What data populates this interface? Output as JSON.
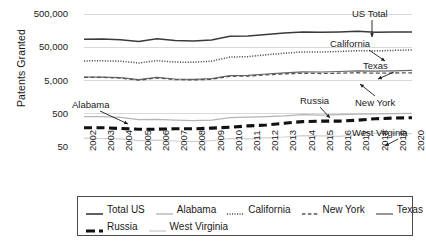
{
  "chart_data": {
    "type": "line",
    "title": "",
    "xlabel": "",
    "ylabel": "Patents Granted",
    "yscale": "log",
    "ylim": [
      50,
      500000
    ],
    "ytick_labels": [
      "500,000",
      "50,000",
      "5,000",
      "500",
      "50"
    ],
    "ytick_values": [
      500000,
      50000,
      5000,
      500,
      50
    ],
    "grid": true,
    "legend_position": "bottom",
    "x": [
      2002,
      2003,
      2004,
      2005,
      2006,
      2007,
      2008,
      2009,
      2010,
      2011,
      2012,
      2013,
      2014,
      2015,
      2016,
      2017,
      2018,
      2019,
      2020
    ],
    "categories": [
      "2002",
      "2003",
      "2004",
      "2005",
      "2006",
      "2007",
      "2008",
      "2009",
      "2010",
      "2011",
      "2012",
      "2013",
      "2014",
      "2015",
      "2016",
      "2017",
      "2018",
      "2019",
      "2020"
    ],
    "series": [
      {
        "name": "Total US",
        "key": "total_us",
        "style": "solid-dark",
        "values": [
          86977,
          87900,
          84271,
          74637,
          89823,
          79526,
          77501,
          82382,
          107792,
          108626,
          121026,
          133593,
          144621,
          140969,
          143723,
          150949,
          142000,
          143000,
          145000
        ]
      },
      {
        "name": "Alabama",
        "key": "alabama",
        "style": "solid-light",
        "values": [
          410,
          407,
          390,
          333,
          341,
          322,
          312,
          320,
          381,
          395,
          411,
          432,
          470,
          455,
          471,
          488,
          500,
          505,
          515
        ]
      },
      {
        "name": "California",
        "key": "california",
        "style": "dotted",
        "values": [
          19400,
          19500,
          19000,
          16800,
          19700,
          17900,
          17700,
          19200,
          25300,
          26100,
          29600,
          33100,
          36300,
          35900,
          37200,
          39500,
          38700,
          40100,
          41500
        ]
      },
      {
        "name": "New York",
        "key": "new_york",
        "style": "dashed",
        "values": [
          6220,
          6180,
          5900,
          5120,
          5980,
          5320,
          5200,
          5420,
          6700,
          6800,
          7400,
          7900,
          8300,
          8100,
          8300,
          8600,
          8300,
          8400,
          8500
        ]
      },
      {
        "name": "Texas",
        "key": "texas",
        "style": "solid-mid",
        "values": [
          6380,
          6330,
          6050,
          5300,
          6200,
          5550,
          5450,
          5700,
          7000,
          7150,
          7850,
          8500,
          9100,
          9000,
          9300,
          9700,
          9500,
          9800,
          10100
        ]
      },
      {
        "name": "Russia",
        "key": "russia",
        "style": "thick-dashed",
        "values": [
          190,
          190,
          180,
          172,
          172,
          176,
          176,
          185,
          195,
          215,
          230,
          260,
          290,
          300,
          300,
          320,
          355,
          370,
          380
        ]
      },
      {
        "name": "West Virginia",
        "key": "west_virginia",
        "style": "solid-pale",
        "values": [
          92,
          90,
          88,
          78,
          80,
          76,
          72,
          78,
          90,
          88,
          94,
          100,
          110,
          108,
          104,
          118,
          130,
          128,
          126
        ]
      }
    ],
    "annotations": [
      {
        "label": "US Total",
        "target_series": "total_us"
      },
      {
        "label": "California",
        "target_series": "california"
      },
      {
        "label": "Texas",
        "target_series": "texas"
      },
      {
        "label": "New York",
        "target_series": "new_york"
      },
      {
        "label": "Alabama",
        "target_series": "alabama"
      },
      {
        "label": "Russia",
        "target_series": "russia"
      },
      {
        "label": "West Virginia",
        "target_series": "west_virginia"
      }
    ]
  },
  "axis": {
    "y_title": "Patents Granted",
    "y_ticks": [
      "500,000",
      "50,000",
      "5,000",
      "500",
      "50"
    ],
    "x_ticks": [
      "2002",
      "2003",
      "2004",
      "2005",
      "2006",
      "2007",
      "2008",
      "2009",
      "2010",
      "2011",
      "2012",
      "2013",
      "2014",
      "2015",
      "2016",
      "2017",
      "2018",
      "2019",
      "2020"
    ]
  },
  "legend": {
    "row1": [
      {
        "label": "Total US",
        "style": "solid-dark"
      },
      {
        "label": "Alabama",
        "style": "solid-light"
      },
      {
        "label": "California",
        "style": "dotted"
      },
      {
        "label": "New York",
        "style": "dashed"
      },
      {
        "label": "Texas",
        "style": "solid-mid"
      }
    ],
    "row2": [
      {
        "label": "Russia",
        "style": "thick-dashed"
      },
      {
        "label": "West Virginia",
        "style": "solid-pale"
      }
    ]
  },
  "annotations": {
    "us_total": "US Total",
    "california": "California",
    "texas": "Texas",
    "new_york": "New York",
    "alabama": "Alabama",
    "russia": "Russia",
    "west_virginia": "West Virginia"
  },
  "colors": {
    "total_us": "#3a3a3a",
    "alabama": "#b5b5b5",
    "california": "#4a4a4a",
    "new_york": "#555555",
    "texas": "#6a6a6a",
    "russia": "#111111",
    "west_virginia": "#cfcfcf",
    "grid": "#d9d9d9",
    "axis": "#9a9a9a"
  }
}
